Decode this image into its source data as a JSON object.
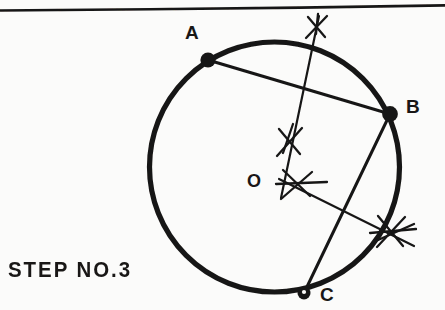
{
  "figure": {
    "caption": "STEP NO.3",
    "ink_color": "#191716",
    "paper_color": "#fbfbfa",
    "top_rule": {
      "name": "page-border-rule",
      "visible": true
    },
    "circle": {
      "cx": 274.5,
      "cy": 167,
      "r": 125,
      "stroke_width": 5.2
    },
    "points": [
      {
        "id": "A",
        "label": "A",
        "x": 208,
        "y": 60,
        "label_x": 185,
        "label_y": 22,
        "dot_r": 7.5
      },
      {
        "id": "B",
        "label": "B",
        "x": 390,
        "y": 114,
        "label_x": 406,
        "label_y": 96,
        "dot_r": 7.8
      },
      {
        "id": "C",
        "label": "C",
        "x": 304,
        "y": 293,
        "label_x": 320,
        "label_y": 284,
        "dot_r": 6.4
      },
      {
        "id": "O",
        "label": "O",
        "x": 286,
        "y": 172,
        "label_x": 248,
        "label_y": 171,
        "dot_r": 0
      }
    ],
    "chords": [
      {
        "name": "chord-ab",
        "from": "A",
        "to": "B",
        "x1": 208,
        "y1": 60,
        "x2": 390,
        "y2": 114
      },
      {
        "name": "chord-bc",
        "from": "B",
        "to": "C",
        "x1": 390,
        "y1": 114,
        "x2": 304,
        "y2": 293
      }
    ],
    "bisectors": [
      {
        "name": "perpendicular-bisector-ab",
        "x1": 319,
        "y1": 16,
        "x2": 281,
        "y2": 198
      },
      {
        "name": "perpendicular-bisector-bc",
        "x1": 281,
        "y1": 180,
        "x2": 414,
        "y2": 245
      }
    ],
    "arc_crosses": [
      {
        "name": "arc-cross-top",
        "x": 317,
        "y": 27,
        "rot": -8,
        "size": 20
      },
      {
        "name": "arc-cross-upper-center",
        "x": 289,
        "y": 142,
        "rot": -6,
        "size": 20
      },
      {
        "name": "arc-cross-lower-center",
        "x": 298,
        "y": 185,
        "rot": 20,
        "size": 21
      },
      {
        "name": "arc-cross-right",
        "x": 391,
        "y": 231,
        "rot": 14,
        "size": 22
      }
    ]
  }
}
